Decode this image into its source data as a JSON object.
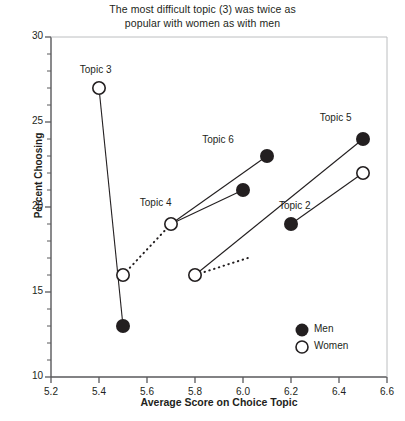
{
  "chart_data": {
    "type": "scatter",
    "title": "The most difficult topic (3) was twice as popular with women as with men",
    "title_line_1": "The most difficult topic (3) was twice as",
    "title_line_2": "popular with women as with men",
    "xlabel": "Average Score on Choice Topic",
    "ylabel": "Percent Choosing",
    "xlim": [
      5.2,
      6.6
    ],
    "ylim": [
      10,
      30
    ],
    "xticks": [
      "5.2",
      "5.4",
      "5.6",
      "5.8",
      "6.0",
      "6.2",
      "6.4",
      "6.6"
    ],
    "xtick_values": [
      5.2,
      5.4,
      5.6,
      5.8,
      6.0,
      6.2,
      6.4,
      6.6
    ],
    "yticks": [
      "10",
      "15",
      "20",
      "25",
      "30"
    ],
    "ytick_values": [
      10,
      15,
      20,
      25,
      30
    ],
    "y_minor_step": 1,
    "x_minor_step": 0.2,
    "grid": false,
    "legend_position": "bottom-right",
    "series": [
      {
        "name": "Men",
        "marker": "filled-circle",
        "color": "#231f20"
      },
      {
        "name": "Women",
        "marker": "open-circle",
        "color": "#231f20"
      }
    ],
    "topics": [
      {
        "label": "Topic 3",
        "label_x": 5.42,
        "label_y": 28.0,
        "women": {
          "x": 5.4,
          "y": 27
        },
        "men": {
          "x": 5.5,
          "y": 13
        }
      },
      {
        "label": "Topic 4",
        "label_x": 5.67,
        "label_y": 20.2,
        "women": {
          "x": 5.7,
          "y": 19
        },
        "men": {
          "x": 6.0,
          "y": 21
        }
      },
      {
        "label": "Topic 6",
        "label_x": 5.93,
        "label_y": 23.9,
        "women": {
          "x": 5.7,
          "y": 19
        },
        "men": {
          "x": 6.1,
          "y": 23
        }
      },
      {
        "label": "Topic 5",
        "label_x": 6.42,
        "label_y": 25.2,
        "women": {
          "x": 5.8,
          "y": 16
        },
        "men": {
          "x": 6.5,
          "y": 24
        }
      },
      {
        "label": "Topic 2",
        "label_x": 6.25,
        "label_y": 20.0,
        "women": {
          "x": 6.5,
          "y": 22
        },
        "men": {
          "x": 6.2,
          "y": 19
        }
      }
    ],
    "dotted_connectors": [
      {
        "from": {
          "x": 5.5,
          "y": 16
        },
        "to": {
          "x": 5.7,
          "y": 19
        }
      },
      {
        "from": {
          "x": 5.8,
          "y": 16
        },
        "to": {
          "x": 6.02,
          "y": 17.0
        }
      }
    ],
    "extra_points": [
      {
        "x": 5.5,
        "y": 16,
        "marker": "open-circle"
      },
      {
        "x": 5.8,
        "y": 16,
        "marker": "open-circle"
      }
    ],
    "annotations": []
  }
}
